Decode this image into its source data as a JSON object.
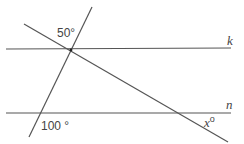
{
  "diagram": {
    "type": "parallel-lines-with-transversals",
    "lines": {
      "k": {
        "label": "k",
        "from": [
          6,
          49
        ],
        "to": [
          231,
          48
        ]
      },
      "n": {
        "label": "n",
        "from": [
          6,
          113
        ],
        "to": [
          231,
          113
        ]
      },
      "transversal_steep": {
        "from": [
          92,
          7
        ],
        "to": [
          29,
          137
        ]
      },
      "transversal_diagonal": {
        "from": [
          24,
          24
        ],
        "to": [
          228,
          142
        ]
      }
    },
    "angles": {
      "top": {
        "label": "50°"
      },
      "bottom_left": {
        "label": "100 °"
      },
      "unknown": {
        "label": "x°",
        "var": "x",
        "degree": "o"
      }
    },
    "line_color": "#555555",
    "text_color": "#444444"
  }
}
